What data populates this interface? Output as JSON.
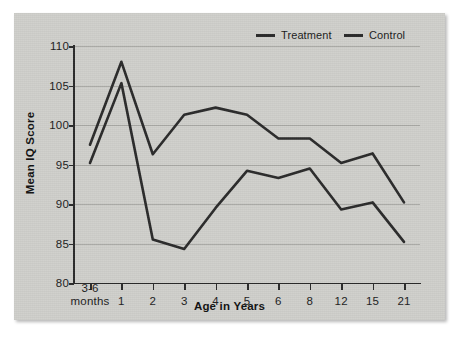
{
  "chart_data": {
    "type": "line",
    "title": "",
    "subtitle": "",
    "xlabel": "Age in Years",
    "ylabel": "Mean IQ Score",
    "categories": [
      "3-6\nmonths",
      "1",
      "2",
      "3",
      "4",
      "5",
      "6",
      "8",
      "12",
      "15",
      "21"
    ],
    "category_labels": [
      {
        "main": "3-6",
        "sub": "months"
      },
      {
        "main": "1",
        "sub": ""
      },
      {
        "main": "2",
        "sub": ""
      },
      {
        "main": "3",
        "sub": ""
      },
      {
        "main": "4",
        "sub": ""
      },
      {
        "main": "5",
        "sub": ""
      },
      {
        "main": "6",
        "sub": ""
      },
      {
        "main": "8",
        "sub": ""
      },
      {
        "main": "12",
        "sub": ""
      },
      {
        "main": "15",
        "sub": ""
      },
      {
        "main": "21",
        "sub": ""
      }
    ],
    "ylim": [
      80,
      110
    ],
    "yticks": [
      80,
      85,
      90,
      95,
      100,
      105,
      110
    ],
    "ytick_labels": [
      "80",
      "85",
      "90",
      "95",
      "100",
      "105",
      "110"
    ],
    "grid": true,
    "grid_axis": "y",
    "legend_position": "top-right",
    "series": [
      {
        "name": "Treatment",
        "color": "#2a2a2a",
        "values": [
          97.5,
          108.0,
          96.3,
          101.3,
          102.2,
          101.3,
          98.3,
          98.3,
          95.2,
          96.4,
          90.2
        ]
      },
      {
        "name": "Control",
        "color": "#2a2a2a",
        "values": [
          95.2,
          105.3,
          85.5,
          84.3,
          89.5,
          94.2,
          93.3,
          94.5,
          89.3,
          90.2,
          85.2
        ]
      }
    ]
  },
  "legend": {
    "treatment_label": "Treatment",
    "control_label": "Control"
  },
  "axes": {
    "y_title": "Mean IQ Score",
    "x_title": "Age in Years"
  },
  "colors": {
    "plot_background": "#cfcfcb",
    "page_background": "#ffffff",
    "line": "#2a2a2a",
    "gridline": "#a9a9a5",
    "axis": "#2a2a2a",
    "text": "#1c1c1c"
  }
}
